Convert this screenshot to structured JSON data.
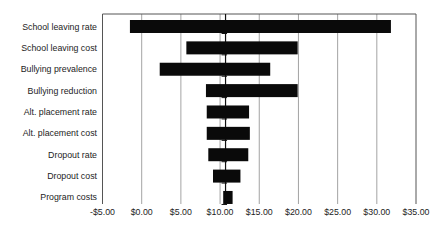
{
  "figure": {
    "background": "#ffffff"
  },
  "chart_data": {
    "type": "bar",
    "subtype": "tornado-sensitivity",
    "orientation": "horizontal",
    "title": "",
    "xlabel": "",
    "ylabel": "",
    "xlim": [
      -5,
      35
    ],
    "x_tick_values": [
      -5,
      0,
      5,
      10,
      15,
      20,
      25,
      30,
      35
    ],
    "x_tick_labels": [
      "-$5.00",
      "$0.00",
      "$5.00",
      "$10.00",
      "$15.00",
      "$20.00",
      "$25.00",
      "$30.00",
      "$35.00"
    ],
    "categories": [
      "School leaving rate",
      "School leaving cost",
      "Bullying prevalence",
      "Bullying reduction",
      "Alt. placement rate",
      "Alt. placement cost",
      "Dropout rate",
      "Dropout cost",
      "Program costs"
    ],
    "series": [
      {
        "name": "range",
        "low": [
          -1.5,
          5.7,
          2.3,
          8.2,
          8.3,
          8.3,
          8.5,
          9.1,
          10.4
        ],
        "high": [
          31.8,
          19.9,
          16.4,
          19.9,
          13.7,
          13.8,
          13.6,
          12.6,
          11.6
        ]
      }
    ],
    "base_value": 10.7,
    "grid": "on",
    "legend": "none",
    "bar_color": "#0a0a0a",
    "grid_color": "#8c8c8c",
    "axis_color": "#555555",
    "base_line_color": "#111111",
    "text_color": "#1c1c1c"
  }
}
